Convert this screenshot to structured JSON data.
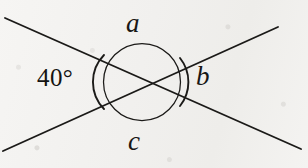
{
  "figure": {
    "kind": "geometry-diagram",
    "background_color": "#f3f2f0",
    "ink_color": "#1b1a18",
    "width": 308,
    "height": 168
  },
  "labels": {
    "angle_top": "a",
    "angle_right": "b",
    "angle_bottom": "c",
    "angle_left_value": "40°"
  },
  "geometry": {
    "intersection": {
      "x": 142,
      "y": 82
    },
    "circle": {
      "cx": 142,
      "cy": 82,
      "r": 38.5
    },
    "lines": [
      {
        "name": "line-descending",
        "x1": 5,
        "y1": 18,
        "x2": 301,
        "y2": 149
      },
      {
        "name": "line-ascending",
        "x1": 3,
        "y1": 151,
        "x2": 278,
        "y2": 27
      }
    ],
    "arcs": [
      {
        "name": "arc-left-40-degrees",
        "d": "M 104 55 A 38.5 38.5 0 0 0 104 109"
      },
      {
        "name": "arc-right-b",
        "d": "M 180 58 A 38.5 38.5 0 0 1 180 106"
      }
    ]
  }
}
